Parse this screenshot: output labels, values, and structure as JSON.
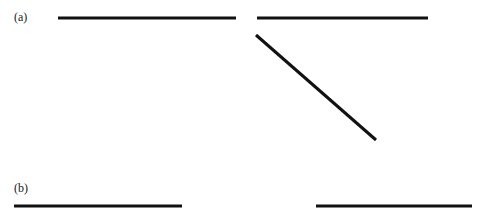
{
  "panels": [
    {
      "id": "a",
      "label": "(a)",
      "label_pos": {
        "x": 14,
        "y": 11
      },
      "segments": [
        {
          "x1": 58,
          "y1": 18,
          "x2": 236,
          "y2": 18
        },
        {
          "x1": 257,
          "y1": 18,
          "x2": 428,
          "y2": 18
        },
        {
          "x1": 256,
          "y1": 35,
          "x2": 376,
          "y2": 140
        }
      ]
    },
    {
      "id": "b",
      "label": "(b)",
      "label_pos": {
        "x": 14,
        "y": 182
      },
      "segments": [
        {
          "x1": 14,
          "y1": 206,
          "x2": 182,
          "y2": 206
        },
        {
          "x1": 316,
          "y1": 206,
          "x2": 472,
          "y2": 206
        }
      ]
    }
  ],
  "style": {
    "stroke_color": "#111111",
    "stroke_width": 3,
    "background": "#ffffff"
  }
}
